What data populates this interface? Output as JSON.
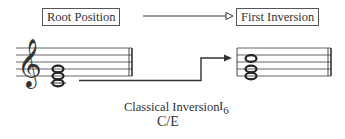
{
  "labels": {
    "root_position": "Root Position",
    "first_inversion": "First Inversion"
  },
  "caption": {
    "title": "Classical Inversion",
    "chord_symbol": "C/E",
    "roman_numeral": "I",
    "figured_bass": "6"
  },
  "chords": {
    "root_position_notes": [
      "C",
      "E",
      "G"
    ],
    "first_inversion_notes": [
      "E",
      "G",
      "C"
    ]
  },
  "clef": "treble-clef",
  "colors": {
    "ink": "#333333",
    "background": "#ffffff"
  }
}
